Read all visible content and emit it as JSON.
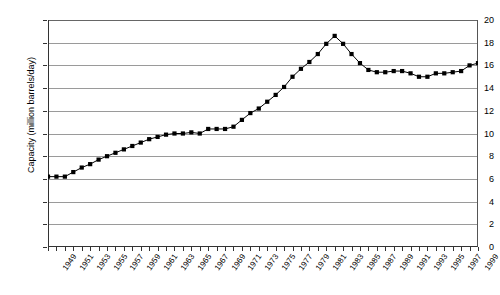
{
  "chart_data": {
    "type": "line",
    "title": "",
    "xlabel": "",
    "ylabel": "Capacity (million barrels/day)",
    "ylim": [
      0,
      20
    ],
    "yticks": [
      0,
      2,
      4,
      6,
      8,
      10,
      12,
      14,
      16,
      18,
      20
    ],
    "xlim": [
      1949,
      2000
    ],
    "xticks": [
      1949,
      1951,
      1953,
      1955,
      1957,
      1959,
      1961,
      1963,
      1965,
      1967,
      1969,
      1971,
      1973,
      1975,
      1977,
      1979,
      1981,
      1983,
      1985,
      1987,
      1989,
      1991,
      1993,
      1995,
      1997,
      1999
    ],
    "grid": true,
    "legend": "none",
    "marker": "square",
    "series_color": "#000000",
    "x": [
      1949,
      1950,
      1951,
      1952,
      1953,
      1954,
      1955,
      1956,
      1957,
      1958,
      1959,
      1960,
      1961,
      1962,
      1963,
      1964,
      1965,
      1966,
      1967,
      1968,
      1969,
      1970,
      1971,
      1972,
      1973,
      1974,
      1975,
      1976,
      1977,
      1978,
      1979,
      1980,
      1981,
      1982,
      1983,
      1984,
      1985,
      1986,
      1987,
      1988,
      1989,
      1990,
      1991,
      1992,
      1993,
      1994,
      1995,
      1996,
      1997,
      1998,
      1999,
      2000
    ],
    "values": [
      6.2,
      6.2,
      6.2,
      6.6,
      7.0,
      7.3,
      7.7,
      8.0,
      8.3,
      8.6,
      8.9,
      9.2,
      9.5,
      9.7,
      9.9,
      10.0,
      10.0,
      10.1,
      10.0,
      10.4,
      10.4,
      10.4,
      10.6,
      11.2,
      11.8,
      12.2,
      12.8,
      13.4,
      14.1,
      15.0,
      15.7,
      16.3,
      17.0,
      17.9,
      18.6,
      17.9,
      17.0,
      16.2,
      15.6,
      15.4,
      15.4,
      15.5,
      15.5,
      15.3,
      15.0,
      15.0,
      15.3,
      15.3,
      15.4,
      15.5,
      16.0,
      16.2
    ],
    "series_name": "Refinery capacity"
  },
  "axis": {
    "y_title": "Capacity (million barrels/day)"
  }
}
